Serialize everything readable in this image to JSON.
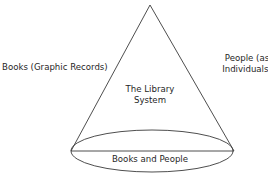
{
  "diagram": {
    "type": "cone",
    "labels": {
      "left": "Books (Graphic Records)",
      "right_line1": "People (as",
      "right_line2": "Individuals)",
      "center_line1": "The Library",
      "center_line2": "System",
      "base": "Books and People"
    },
    "colors": {
      "stroke": "#3a3a3a",
      "text": "#1f1f1f",
      "background": "#ffffff"
    }
  }
}
